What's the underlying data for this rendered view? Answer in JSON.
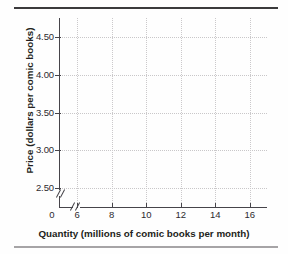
{
  "chart_data": {
    "type": "line",
    "title": "",
    "xlabel": "Quantity (millions of comic books per month)",
    "ylabel": "Price (dollars per comic books)",
    "xlim": [
      5,
      17
    ],
    "ylim": [
      2.25,
      4.75
    ],
    "xticks": [
      "6",
      "8",
      "10",
      "12",
      "14",
      "16"
    ],
    "xtick_values": [
      6,
      8,
      10,
      12,
      14,
      16
    ],
    "yticks": [
      "2.50",
      "3.00",
      "3.50",
      "4.00",
      "4.50"
    ],
    "ytick_values": [
      2.5,
      3.0,
      3.5,
      4.0,
      4.5
    ],
    "origin_label": "0",
    "grid": true,
    "legend": null,
    "series": [],
    "values": [],
    "categories": [],
    "axis_break_x": true,
    "axis_break_y": true
  },
  "colors": {
    "axis": "#46444a",
    "grid": "#c9c7c9",
    "text": "#231f20",
    "rule_top": "#3b3a3c",
    "rule_bottom": "#a6a4a6",
    "background": "#fefefe"
  }
}
